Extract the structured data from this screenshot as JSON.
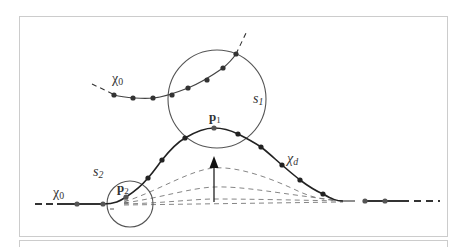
{
  "figure": {
    "labels": {
      "chi0_top": {
        "base": "χ",
        "sub": "0"
      },
      "chi0_bottom": {
        "base": "χ",
        "sub": "0"
      },
      "chi_d": {
        "base": "χ",
        "sub": "d"
      },
      "s1": {
        "base": "s",
        "sub": "1"
      },
      "s2": {
        "base": "s",
        "sub": "2"
      },
      "p1": {
        "base": "p",
        "sub": "1"
      },
      "p2": {
        "base": "p",
        "sub": "2"
      }
    },
    "colors": {
      "curve": "#222222",
      "circle": "#555555",
      "dashed_guides": "#777777",
      "frame": "#cccccc",
      "text": "#333333"
    },
    "upper_curve_points": [
      [
        114,
        95
      ],
      [
        133,
        98
      ],
      [
        153,
        98
      ],
      [
        172,
        95
      ],
      [
        188,
        88
      ],
      [
        207,
        80
      ],
      [
        223,
        68
      ],
      [
        236,
        54
      ]
    ],
    "lower_curve_points": [
      [
        77,
        204
      ],
      [
        103,
        204
      ],
      [
        126,
        197
      ],
      [
        148,
        178
      ],
      [
        162,
        160
      ],
      [
        185,
        138
      ],
      [
        214,
        128
      ],
      [
        238,
        134
      ],
      [
        261,
        147
      ],
      [
        282,
        165
      ],
      [
        300,
        180
      ],
      [
        323,
        194
      ],
      [
        365,
        201
      ],
      [
        385,
        201
      ]
    ],
    "circle_s1": {
      "cx": 217,
      "cy": 99,
      "r": 49
    },
    "circle_s2": {
      "cx": 130,
      "cy": 204,
      "r": 23
    }
  }
}
